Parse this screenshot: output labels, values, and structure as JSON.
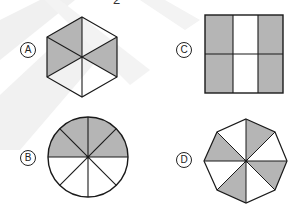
{
  "header": {
    "question_number_fragment": "2"
  },
  "colors": {
    "shade": "#b5b5b5",
    "stroke": "#1a1a1a",
    "watermark": "#efefef"
  },
  "options": [
    {
      "label": "A",
      "shape": "hexagon",
      "parts": 6,
      "shaded_parts": 3
    },
    {
      "label": "B",
      "shape": "circle",
      "parts": 8,
      "shaded_parts": 4
    },
    {
      "label": "C",
      "shape": "square",
      "parts": 6,
      "shaded_parts": 4
    },
    {
      "label": "D",
      "shape": "octagon",
      "parts": 8,
      "shaded_parts": 4
    }
  ]
}
